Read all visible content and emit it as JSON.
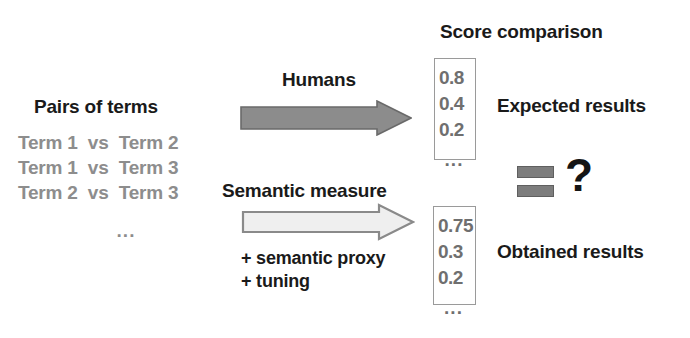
{
  "figure": {
    "left_panel": {
      "title": "Pairs of terms",
      "pairs": [
        "Term 1  vs  Term 2",
        "Term 1  vs  Term 3",
        "Term 2  vs  Term 3"
      ],
      "ellipsis": "..."
    },
    "flows": {
      "top": {
        "label": "Humans",
        "arrow_icon": "right-arrow-filled",
        "arrow_fill": "#8c8c8c",
        "arrow_stroke": "#6a6a6a"
      },
      "bottom": {
        "label": "Semantic measure",
        "arrow_icon": "right-arrow-outline",
        "arrow_fill": "#efefef",
        "arrow_stroke": "#8a8a8a",
        "notes": [
          "+ semantic proxy",
          "+ tuning"
        ]
      }
    },
    "comparison": {
      "title": "Score comparison",
      "expected": {
        "label": "Expected results",
        "scores": [
          "0.8",
          "0.4",
          "0.2"
        ],
        "ellipsis": "..."
      },
      "obtained": {
        "label": "Obtained results",
        "scores": [
          "0.75",
          "0.3",
          "0.2"
        ],
        "ellipsis": "..."
      },
      "equals_icon": "equals-sign",
      "question_mark": "?"
    },
    "colors": {
      "text": "#1a1a1a",
      "muted_text": "#8d8d8d",
      "score_text": "#6f6f6f",
      "box_border": "#9a9a9a",
      "equals_bar": "#7d7d7d",
      "background": "#ffffff"
    }
  }
}
